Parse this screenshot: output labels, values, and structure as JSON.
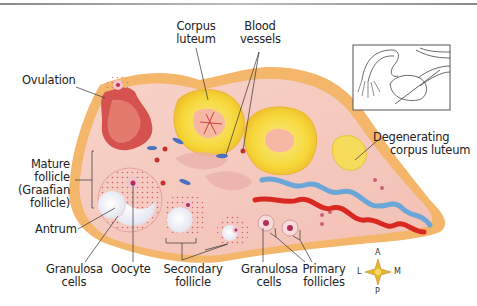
{
  "diagram": {
    "labels": {
      "ovulation": "Ovulation",
      "corpus_luteum": [
        "Corpus",
        "luteum"
      ],
      "blood_vessels": [
        "Blood",
        "vessels"
      ],
      "degenerating_corpus_luteum": [
        "Degenerating",
        "corpus luteum"
      ],
      "mature_follicle": [
        "Mature",
        "follicle",
        "(Graafian",
        "follicle)"
      ],
      "antrum": "Antrum",
      "granulosa_cells_left": [
        "Granulosa",
        "cells"
      ],
      "oocyte": "Oocyte",
      "secondary_follicle": [
        "Secondary",
        "follicle"
      ],
      "granulosa_cells_right": [
        "Granulosa",
        "cells"
      ],
      "primary_follicles": [
        "Primary",
        "follicles"
      ]
    },
    "compass": {
      "anterior": "A",
      "posterior": "P",
      "lateral": "L",
      "medial": "M"
    },
    "inset": {
      "description": "Uterus, tube and ovary orientation sketch"
    },
    "colors": {
      "capsule": "#f4b96a",
      "stroma": "#f6cfc4",
      "corpus_luteum": "#f7df4a",
      "artery": "#d8281f",
      "vein": "#6aa6d8",
      "follicle_fill": "#eef0f6",
      "granulosa_dots": "#d06070"
    }
  }
}
